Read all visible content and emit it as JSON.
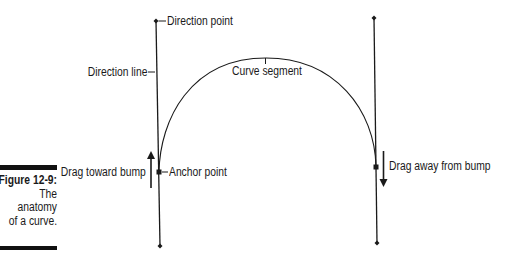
{
  "figure": {
    "number": "Figure 12-9:",
    "caption_lines": [
      "The",
      "anatomy",
      "of a curve."
    ]
  },
  "labels": {
    "direction_point": "Direction point",
    "direction_line": "Direction line",
    "curve_segment": "Curve segment",
    "anchor_point": "Anchor point",
    "drag_toward": "Drag toward bump",
    "drag_away": "Drag away from bump"
  },
  "geometry": {
    "left_direction_line": {
      "top": [
        156,
        21
      ],
      "bottom": [
        160,
        246
      ]
    },
    "right_direction_line": {
      "top": [
        374,
        18
      ],
      "bottom": [
        377,
        243
      ]
    },
    "left_anchor": [
      159,
      172
    ],
    "right_anchor": [
      376,
      167
    ],
    "curve_apex": [
      266,
      58
    ]
  },
  "colors": {
    "line": "#1a1a1a",
    "background": "#ffffff"
  }
}
